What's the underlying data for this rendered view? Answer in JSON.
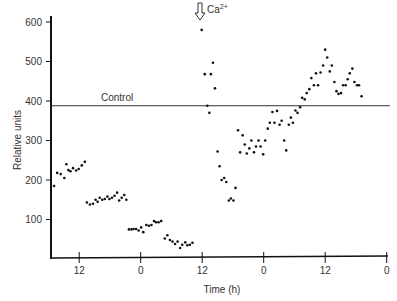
{
  "chart_data": {
    "type": "scatter",
    "title": "",
    "xlabel": "Time (h)",
    "ylabel": "Relative units",
    "ylim": [
      0,
      620
    ],
    "yticks": [
      100,
      200,
      300,
      400,
      500,
      600
    ],
    "xticks": [
      {
        "hours_elapsed": 5.5,
        "label": "12"
      },
      {
        "hours_elapsed": 17.5,
        "label": "0"
      },
      {
        "hours_elapsed": 29.5,
        "label": "12"
      },
      {
        "hours_elapsed": 41.5,
        "label": "0"
      },
      {
        "hours_elapsed": 53.5,
        "label": "12"
      },
      {
        "hours_elapsed": 65.5,
        "label": "0"
      }
    ],
    "xlim_hours_elapsed": [
      0,
      66.5
    ],
    "grid": false,
    "reference_line": {
      "label": "Control",
      "value": 388
    },
    "annotations": [
      {
        "text": "Ca",
        "superscript": "2+",
        "type": "down-arrow",
        "hours_elapsed": 29.2
      }
    ],
    "series": [
      {
        "name": "Relative units",
        "points": [
          [
            0.6,
            185
          ],
          [
            1.2,
            218
          ],
          [
            1.9,
            215
          ],
          [
            2.6,
            205
          ],
          [
            3.0,
            240
          ],
          [
            3.4,
            225
          ],
          [
            3.8,
            222
          ],
          [
            4.3,
            230
          ],
          [
            4.9,
            224
          ],
          [
            5.4,
            228
          ],
          [
            6.0,
            237
          ],
          [
            6.6,
            246
          ],
          [
            7.0,
            143
          ],
          [
            7.6,
            138
          ],
          [
            8.2,
            140
          ],
          [
            8.7,
            150
          ],
          [
            9.1,
            145
          ],
          [
            9.5,
            155
          ],
          [
            10.0,
            150
          ],
          [
            10.5,
            152
          ],
          [
            11.0,
            158
          ],
          [
            11.4,
            152
          ],
          [
            11.9,
            155
          ],
          [
            12.4,
            160
          ],
          [
            12.9,
            168
          ],
          [
            13.3,
            148
          ],
          [
            13.8,
            155
          ],
          [
            14.3,
            162
          ],
          [
            14.7,
            150
          ],
          [
            15.2,
            75
          ],
          [
            15.7,
            75
          ],
          [
            16.1,
            76
          ],
          [
            16.6,
            76
          ],
          [
            17.1,
            72
          ],
          [
            17.6,
            80
          ],
          [
            18.0,
            68
          ],
          [
            18.6,
            86
          ],
          [
            19.1,
            84
          ],
          [
            19.6,
            86
          ],
          [
            20.1,
            96
          ],
          [
            20.5,
            93
          ],
          [
            21.0,
            93
          ],
          [
            21.5,
            96
          ],
          [
            22.2,
            52
          ],
          [
            22.7,
            60
          ],
          [
            23.2,
            48
          ],
          [
            23.7,
            44
          ],
          [
            24.2,
            38
          ],
          [
            24.7,
            44
          ],
          [
            25.2,
            28
          ],
          [
            25.6,
            36
          ],
          [
            26.2,
            42
          ],
          [
            26.6,
            35
          ],
          [
            27.1,
            36
          ],
          [
            27.6,
            41
          ],
          [
            29.4,
            580
          ],
          [
            30.0,
            468
          ],
          [
            30.5,
            388
          ],
          [
            30.9,
            370
          ],
          [
            31.2,
            468
          ],
          [
            31.6,
            497
          ],
          [
            32.0,
            432
          ],
          [
            32.5,
            272
          ],
          [
            32.9,
            235
          ],
          [
            33.3,
            200
          ],
          [
            33.8,
            205
          ],
          [
            34.2,
            195
          ],
          [
            34.7,
            148
          ],
          [
            35.1,
            153
          ],
          [
            35.6,
            148
          ],
          [
            36.0,
            180
          ],
          [
            36.5,
            326
          ],
          [
            36.9,
            270
          ],
          [
            37.4,
            313
          ],
          [
            37.8,
            290
          ],
          [
            38.2,
            267
          ],
          [
            38.7,
            280
          ],
          [
            39.1,
            300
          ],
          [
            39.6,
            270
          ],
          [
            40.0,
            285
          ],
          [
            40.5,
            300
          ],
          [
            40.9,
            285
          ],
          [
            41.4,
            265
          ],
          [
            41.8,
            300
          ],
          [
            42.3,
            330
          ],
          [
            42.7,
            345
          ],
          [
            43.2,
            372
          ],
          [
            43.6,
            345
          ],
          [
            44.1,
            375
          ],
          [
            44.6,
            340
          ],
          [
            45.0,
            350
          ],
          [
            45.5,
            300
          ],
          [
            45.9,
            275
          ],
          [
            46.4,
            340
          ],
          [
            46.8,
            358
          ],
          [
            47.2,
            345
          ],
          [
            47.7,
            376
          ],
          [
            48.1,
            370
          ],
          [
            48.6,
            384
          ],
          [
            49.0,
            408
          ],
          [
            49.5,
            404
          ],
          [
            49.9,
            420
          ],
          [
            50.4,
            430
          ],
          [
            50.8,
            458
          ],
          [
            51.3,
            440
          ],
          [
            51.7,
            470
          ],
          [
            52.1,
            440
          ],
          [
            52.6,
            472
          ],
          [
            53.1,
            490
          ],
          [
            53.5,
            530
          ],
          [
            53.9,
            510
          ],
          [
            54.4,
            475
          ],
          [
            54.8,
            490
          ],
          [
            55.3,
            448
          ],
          [
            55.7,
            425
          ],
          [
            56.1,
            418
          ],
          [
            56.6,
            420
          ],
          [
            57.0,
            440
          ],
          [
            57.5,
            440
          ],
          [
            57.9,
            455
          ],
          [
            58.3,
            470
          ],
          [
            58.8,
            482
          ],
          [
            59.2,
            448
          ],
          [
            59.7,
            440
          ],
          [
            60.1,
            440
          ],
          [
            60.6,
            412
          ]
        ]
      }
    ]
  }
}
